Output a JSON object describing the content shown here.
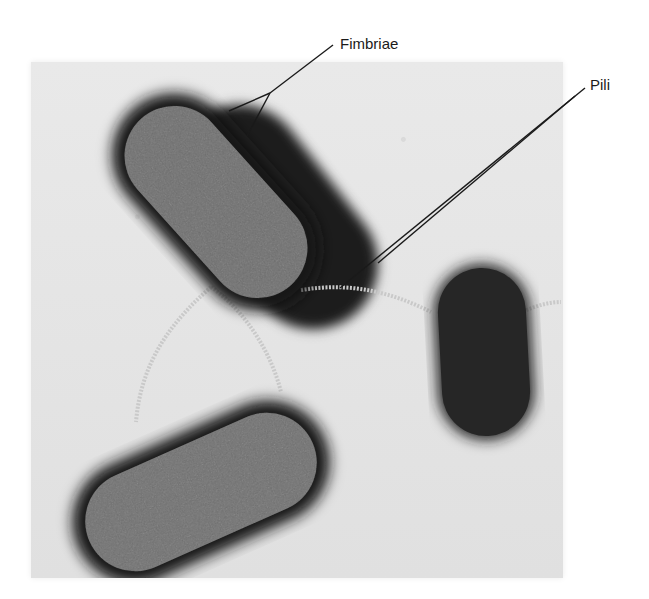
{
  "figure": {
    "type": "electron micrograph",
    "labels": [
      {
        "id": "fimbriae",
        "text": "Fimbriae"
      },
      {
        "id": "pili",
        "text": "Pili"
      }
    ]
  }
}
